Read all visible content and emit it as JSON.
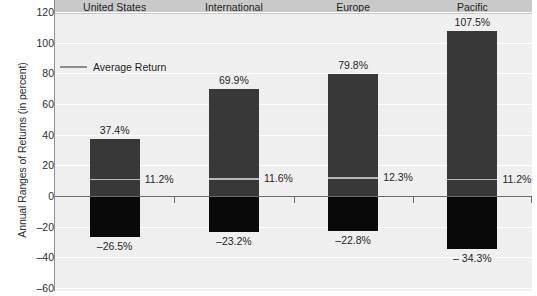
{
  "chart_data": {
    "type": "bar",
    "title": "",
    "xlabel": "",
    "ylabel": "Annual Ranges of Returns (in percent)",
    "ylim": [
      -60,
      120
    ],
    "yticks": [
      120,
      100,
      80,
      60,
      40,
      20,
      0,
      -20,
      -40,
      -60
    ],
    "ytick_labels": [
      "120",
      "100",
      "80",
      "60",
      "40",
      "20",
      "0",
      "–20",
      "–40",
      "–60"
    ],
    "grid": true,
    "legend": {
      "position": "inside-top-left",
      "entries": [
        {
          "label": "Average Return",
          "marker": "line",
          "color": "#8c8c8c"
        }
      ]
    },
    "categories": [
      "United States",
      "International",
      "Europe",
      "Pacific"
    ],
    "series": [
      {
        "name": "High (Best Annual Return)",
        "values": [
          37.4,
          69.9,
          79.8,
          107.5
        ],
        "labels": [
          "37.4%",
          "69.9%",
          "79.8%",
          "107.5%"
        ],
        "color": "#383838"
      },
      {
        "name": "Low (Worst Annual Return)",
        "values": [
          -26.5,
          -23.2,
          -22.8,
          -34.3
        ],
        "labels": [
          "–26.5%",
          "–23.2%",
          "–22.8%",
          "– 34.3%"
        ],
        "color": "#090909"
      },
      {
        "name": "Average Return",
        "values": [
          11.2,
          11.6,
          12.3,
          11.2
        ],
        "labels": [
          "11.2%",
          "11.6%",
          "12.3%",
          "11.2%"
        ],
        "color": "#b9b9b9"
      }
    ],
    "colors": {
      "plot_background": "#efefef",
      "header_band": "#c9c9c9",
      "gridline": "#ffffff",
      "axis": "#6a6a6a",
      "bar_positive": "#383838",
      "bar_negative": "#090909",
      "average_line": "#b9b9b9"
    }
  }
}
